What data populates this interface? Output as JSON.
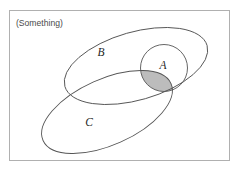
{
  "figure": {
    "type": "venn-diagram",
    "background_color": "#ffffff",
    "stroke_color": "#555555",
    "stroke_width": 0.9,
    "frame": {
      "label": "universe-frame",
      "x": 9,
      "y": 10,
      "width": 221,
      "height": 151,
      "border_color": "#b0b0b0",
      "fill": "#ffffff"
    },
    "universe_label": {
      "text": "(Something)",
      "x": 16,
      "y": 26,
      "color": "#4a4a4a"
    },
    "sets": [
      {
        "id": "B",
        "label": "B",
        "shape": "ellipse",
        "cx": 136,
        "cy": 66,
        "rx": 74,
        "ry": 34,
        "rotation": -16,
        "label_x": 101,
        "label_y": 56,
        "fill": "none",
        "stroke": "#555555"
      },
      {
        "id": "A",
        "label": "A",
        "shape": "circle",
        "cx": 164,
        "cy": 68,
        "rx": 23,
        "ry": 24,
        "rotation": 0,
        "label_x": 163,
        "label_y": 69,
        "fill": "none",
        "stroke": "#555555"
      },
      {
        "id": "C",
        "label": "C",
        "shape": "ellipse",
        "cx": 107,
        "cy": 112,
        "rx": 70,
        "ry": 33,
        "rotation": -24,
        "label_x": 89,
        "label_y": 126,
        "fill": "none",
        "stroke": "#555555"
      }
    ],
    "shaded_region": {
      "name": "intersection-a-b-c",
      "description": "A intersect C shaded lens",
      "fill_color": "#bcbcbc",
      "stroke_color": "#555555",
      "opacity": 1
    }
  }
}
